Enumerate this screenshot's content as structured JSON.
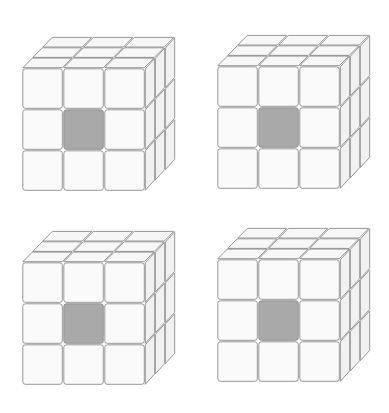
{
  "figure": {
    "width": 389,
    "height": 413,
    "background": "#ffffff",
    "layout": "2x2 grid of Rubik-style 3x3x3 cubes",
    "cube_grid_size": 3,
    "colors": {
      "cell_fill": "#fafafa",
      "top_fill": "#f7f7f7",
      "side_fill": "#f1f1f1",
      "outline": "#8c8c8c",
      "highlight": "#a9a9a9"
    },
    "geometry": {
      "cell_size": 41,
      "cell_gap": 1.5,
      "depth_dx": 30,
      "depth_dy": -31
    },
    "cubes": [
      {
        "id": "cube-top-left",
        "front_origin": [
          22,
          68
        ],
        "highlighted_cells": [
          {
            "face": "front",
            "row": 1,
            "col": 1
          }
        ]
      },
      {
        "id": "cube-top-right",
        "front_origin": [
          217,
          66
        ],
        "highlighted_cells": [
          {
            "face": "front",
            "row": 1,
            "col": 1
          }
        ]
      },
      {
        "id": "cube-bottom-left",
        "front_origin": [
          22,
          262
        ],
        "highlighted_cells": [
          {
            "face": "front",
            "row": 1,
            "col": 1
          }
        ]
      },
      {
        "id": "cube-bottom-right",
        "front_origin": [
          217,
          259
        ],
        "highlighted_cells": [
          {
            "face": "front",
            "row": 1,
            "col": 1
          }
        ]
      }
    ]
  }
}
